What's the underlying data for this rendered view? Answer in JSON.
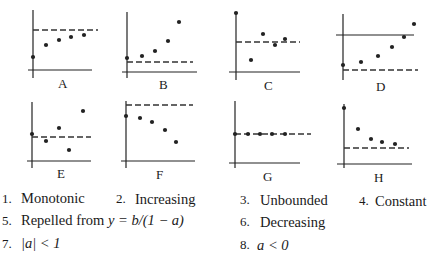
{
  "panels": [
    {
      "label": "A",
      "description": "monotonically increasing toward dashed line from below",
      "points": [
        0.0,
        0.0,
        0.0,
        0.0,
        0.0
      ],
      "solid_reference": false
    },
    {
      "label": "B",
      "description": "increasing away from dashed line above it",
      "solid_reference": false
    },
    {
      "label": "C",
      "description": "oscillating converging to dashed line",
      "solid_reference": false
    },
    {
      "label": "D",
      "description": "increasing away from dashed line, passes a solid horizontal line",
      "solid_reference": true
    },
    {
      "label": "E",
      "description": "oscillating diverging from dashed line",
      "solid_reference": false
    },
    {
      "label": "F",
      "description": "decreasing away from dashed line below it",
      "solid_reference": false
    },
    {
      "label": "G",
      "description": "constant on dashed line",
      "solid_reference": false
    },
    {
      "label": "H",
      "description": "decreasing toward dashed line from above",
      "solid_reference": false
    }
  ],
  "options": [
    {
      "number": "1.",
      "text": "Monotonic"
    },
    {
      "number": "2.",
      "text": "Increasing"
    },
    {
      "number": "3.",
      "text": "Unbounded"
    },
    {
      "number": "4.",
      "text": "Constant"
    },
    {
      "number": "5.",
      "text": "Repelled from",
      "math": "y = b/(1 − a)"
    },
    {
      "number": "6.",
      "text": "Decreasing"
    },
    {
      "number": "7.",
      "text": "",
      "math": "|a| < 1"
    },
    {
      "number": "8.",
      "text": "",
      "math": "a < 0"
    }
  ]
}
